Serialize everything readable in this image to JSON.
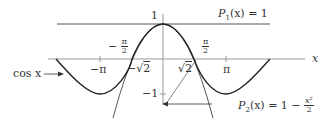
{
  "diagram": {
    "axis_labels": {
      "x": "x"
    },
    "y_ticks": {
      "one": "1",
      "minus_one": "−1"
    },
    "x_ticks": {
      "minus_pi": "−π",
      "pi": "π",
      "minus_sqrt2_sign": "−",
      "sqrt2": "2",
      "minus_pi_half_sign": "−",
      "pi_half_num": "π",
      "pi_half_den": "2"
    },
    "curves": {
      "cos": {
        "label": "cos x",
        "color": "#222222"
      },
      "p1": {
        "label_name": "P",
        "label_sub": "1",
        "label_rest": "(x) = 1",
        "color": "#555555"
      },
      "p2": {
        "label_name": "P",
        "label_sub": "2",
        "label_rest": "(x) = 1 − ",
        "frac_num": "x²",
        "frac_den": "2",
        "color": "#444444"
      }
    },
    "colors": {
      "axis": "#999999",
      "text": "#333333"
    }
  }
}
